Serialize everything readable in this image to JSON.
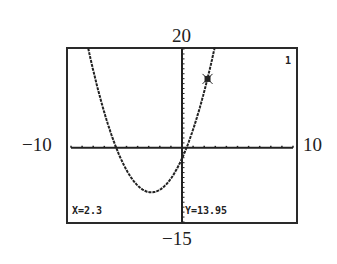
{
  "chart_data": {
    "type": "line",
    "title": "",
    "function_note": "parabola (graphing calculator trace)",
    "window": {
      "xmin": -10,
      "xmax": 10,
      "ymin": -15,
      "ymax": 20
    },
    "xlim": [
      -10,
      10
    ],
    "ylim": [
      -15,
      20
    ],
    "xlabel": "",
    "ylabel": "",
    "tick_labels": {
      "top": "20",
      "bottom": "-15",
      "left": "-10",
      "right": "10"
    },
    "grid": false,
    "series": [
      {
        "name": "Y1",
        "curve": {
          "a": 0.9,
          "h": -2.76,
          "k": -9
        }
      }
    ],
    "trace_point": {
      "x": 2.3,
      "y": 13.95
    },
    "function_index": "1"
  },
  "labels": {
    "ymax": "20",
    "ymin": "−15",
    "xmin": "−10",
    "xmax": "10"
  },
  "screen": {
    "x_readout": "X=2.3",
    "y_readout": "Y=13.95",
    "function_number": "1"
  }
}
